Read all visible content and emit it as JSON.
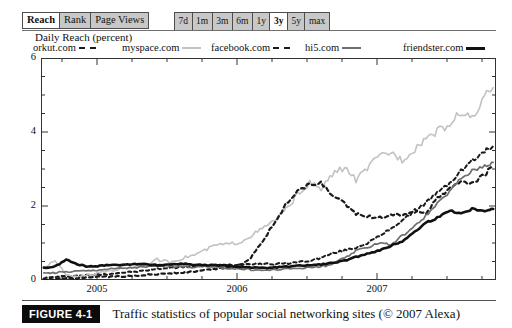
{
  "toolbar": {
    "metric_tabs": [
      {
        "label": "Reach",
        "selected": true
      },
      {
        "label": "Rank",
        "selected": false
      },
      {
        "label": "Page Views",
        "selected": false
      }
    ],
    "range_buttons": [
      {
        "label": "7d",
        "selected": false
      },
      {
        "label": "1m",
        "selected": false
      },
      {
        "label": "3m",
        "selected": false
      },
      {
        "label": "6m",
        "selected": false
      },
      {
        "label": "1y",
        "selected": false
      },
      {
        "label": "3y",
        "selected": true
      },
      {
        "label": "5y",
        "selected": false
      },
      {
        "label": "max",
        "selected": false
      }
    ]
  },
  "caption": {
    "badge": "FIGURE 4-1",
    "text": "Traffic statistics of popular social networking sites (© 2007 Alexa)"
  },
  "colors": {
    "orkut": "#1a1a1a",
    "myspace": "#c2c2c2",
    "facebook": "#1a1a1a",
    "hi5": "#6e6e6e",
    "friendster": "#111111",
    "axis": "#333333",
    "badge_bg": "#0b0b0b",
    "button_bg": "#c8c8c8",
    "button_selected_bg": "#ffffff"
  },
  "chart_data": {
    "type": "line",
    "title": "Daily Reach (percent)",
    "xlabel": "",
    "ylabel": "Daily Reach (percent)",
    "ylim": [
      0,
      6
    ],
    "yticks": [
      0,
      2,
      4,
      6
    ],
    "y_minor_step": 0.5,
    "xlim": [
      2004.6,
      2007.85
    ],
    "xticks": [
      2005,
      2006,
      2007
    ],
    "xticklabels": [
      "2005",
      "2006",
      "2007"
    ],
    "x_minor_step": 0.25,
    "grid": false,
    "legend_position": "above-plot",
    "series": [
      {
        "name": "orkut.com",
        "style": "dashed",
        "color": "#1a1a1a",
        "width": 2.0,
        "x": [
          2004.62,
          2004.7,
          2004.78,
          2004.86,
          2004.94,
          2005.02,
          2005.1,
          2005.18,
          2005.27,
          2005.35,
          2005.43,
          2005.52,
          2005.6,
          2005.68,
          2005.77,
          2005.85,
          2005.93,
          2006.02,
          2006.1,
          2006.18,
          2006.27,
          2006.35,
          2006.43,
          2006.52,
          2006.6,
          2006.68,
          2006.77,
          2006.85,
          2006.93,
          2007.02,
          2007.1,
          2007.18,
          2007.27,
          2007.35,
          2007.43,
          2007.52,
          2007.6,
          2007.68,
          2007.77,
          2007.83
        ],
        "y": [
          0.05,
          0.08,
          0.1,
          0.12,
          0.13,
          0.15,
          0.17,
          0.2,
          0.22,
          0.26,
          0.3,
          0.33,
          0.35,
          0.37,
          0.38,
          0.4,
          0.41,
          0.42,
          0.44,
          0.44,
          0.43,
          0.45,
          0.48,
          0.52,
          0.6,
          0.72,
          0.8,
          0.88,
          1.0,
          1.18,
          1.4,
          1.6,
          1.85,
          2.1,
          2.35,
          2.62,
          2.95,
          3.22,
          3.48,
          3.62
        ]
      },
      {
        "name": "myspace.com",
        "style": "solid",
        "color": "#c2c2c2",
        "width": 1.6,
        "x": [
          2004.62,
          2004.7,
          2004.78,
          2004.86,
          2004.94,
          2005.02,
          2005.1,
          2005.18,
          2005.27,
          2005.35,
          2005.43,
          2005.52,
          2005.6,
          2005.68,
          2005.77,
          2005.85,
          2005.93,
          2006.02,
          2006.1,
          2006.18,
          2006.27,
          2006.35,
          2006.43,
          2006.52,
          2006.6,
          2006.68,
          2006.77,
          2006.85,
          2006.93,
          2007.02,
          2007.1,
          2007.18,
          2007.27,
          2007.35,
          2007.43,
          2007.52,
          2007.6,
          2007.68,
          2007.77,
          2007.83
        ],
        "y": [
          0.3,
          0.55,
          0.12,
          0.1,
          0.14,
          0.2,
          0.26,
          0.3,
          0.36,
          0.42,
          0.55,
          0.48,
          0.58,
          0.66,
          0.8,
          0.95,
          0.96,
          1.02,
          1.2,
          1.38,
          1.62,
          1.9,
          2.3,
          2.62,
          2.45,
          2.85,
          3.05,
          2.7,
          3.02,
          3.35,
          3.45,
          3.25,
          3.55,
          3.85,
          4.02,
          4.2,
          4.55,
          4.35,
          4.95,
          5.2
        ]
      },
      {
        "name": "facebook.com",
        "style": "dashed",
        "color": "#1a1a1a",
        "width": 2.2,
        "x": [
          2004.62,
          2004.7,
          2004.78,
          2004.86,
          2004.94,
          2005.02,
          2005.1,
          2005.18,
          2005.27,
          2005.35,
          2005.43,
          2005.52,
          2005.6,
          2005.68,
          2005.77,
          2005.85,
          2005.93,
          2006.02,
          2006.1,
          2006.18,
          2006.27,
          2006.35,
          2006.43,
          2006.52,
          2006.6,
          2006.68,
          2006.77,
          2006.85,
          2006.93,
          2007.02,
          2007.1,
          2007.18,
          2007.27,
          2007.35,
          2007.43,
          2007.52,
          2007.6,
          2007.68,
          2007.77,
          2007.83
        ],
        "y": [
          0.02,
          0.03,
          0.04,
          0.05,
          0.06,
          0.08,
          0.09,
          0.1,
          0.12,
          0.14,
          0.16,
          0.18,
          0.2,
          0.22,
          0.26,
          0.3,
          0.34,
          0.4,
          0.62,
          1.05,
          1.55,
          2.05,
          2.4,
          2.58,
          2.62,
          2.3,
          2.05,
          1.8,
          1.72,
          1.68,
          1.78,
          1.75,
          1.88,
          1.82,
          2.2,
          2.45,
          2.7,
          2.6,
          2.85,
          3.1
        ]
      },
      {
        "name": "hi5.com",
        "style": "solid",
        "color": "#6e6e6e",
        "width": 1.7,
        "x": [
          2004.62,
          2004.7,
          2004.78,
          2004.86,
          2004.94,
          2005.02,
          2005.1,
          2005.18,
          2005.27,
          2005.35,
          2005.43,
          2005.52,
          2005.6,
          2005.68,
          2005.77,
          2005.85,
          2005.93,
          2006.02,
          2006.1,
          2006.18,
          2006.27,
          2006.35,
          2006.43,
          2006.52,
          2006.6,
          2006.68,
          2006.77,
          2006.85,
          2006.93,
          2007.02,
          2007.1,
          2007.18,
          2007.27,
          2007.35,
          2007.43,
          2007.52,
          2007.6,
          2007.68,
          2007.77,
          2007.83
        ],
        "y": [
          0.18,
          0.2,
          0.22,
          0.24,
          0.25,
          0.28,
          0.3,
          0.32,
          0.34,
          0.35,
          0.38,
          0.36,
          0.37,
          0.35,
          0.36,
          0.34,
          0.32,
          0.3,
          0.28,
          0.26,
          0.28,
          0.3,
          0.32,
          0.34,
          0.36,
          0.42,
          0.6,
          0.78,
          0.88,
          1.02,
          0.95,
          1.2,
          1.45,
          1.75,
          2.05,
          2.4,
          2.75,
          2.95,
          3.1,
          3.18
        ]
      },
      {
        "name": "friendster.com",
        "style": "solid",
        "color": "#111111",
        "width": 2.6,
        "x": [
          2004.62,
          2004.7,
          2004.78,
          2004.86,
          2004.94,
          2005.02,
          2005.1,
          2005.18,
          2005.27,
          2005.35,
          2005.43,
          2005.52,
          2005.6,
          2005.68,
          2005.77,
          2005.85,
          2005.93,
          2006.02,
          2006.1,
          2006.18,
          2006.27,
          2006.35,
          2006.43,
          2006.52,
          2006.6,
          2006.68,
          2006.77,
          2006.85,
          2006.93,
          2007.02,
          2007.1,
          2007.18,
          2007.27,
          2007.35,
          2007.43,
          2007.52,
          2007.6,
          2007.68,
          2007.77,
          2007.83
        ],
        "y": [
          0.33,
          0.36,
          0.55,
          0.42,
          0.36,
          0.38,
          0.42,
          0.4,
          0.44,
          0.42,
          0.4,
          0.42,
          0.44,
          0.42,
          0.4,
          0.4,
          0.38,
          0.36,
          0.34,
          0.32,
          0.34,
          0.36,
          0.38,
          0.4,
          0.42,
          0.46,
          0.52,
          0.62,
          0.72,
          0.8,
          0.92,
          1.05,
          1.3,
          1.55,
          1.68,
          1.88,
          1.8,
          1.92,
          1.88,
          1.92
        ]
      }
    ]
  }
}
